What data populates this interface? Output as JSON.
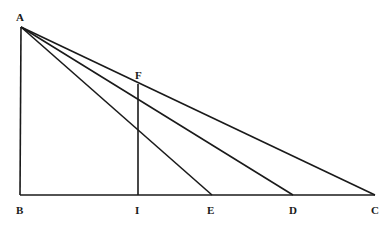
{
  "diagram": {
    "labels": {
      "A": "A",
      "B": "B",
      "I": "I",
      "E": "E",
      "D": "D",
      "C": "C",
      "F": "F"
    },
    "points": {
      "A": [
        21,
        27
      ],
      "B": [
        20,
        195
      ],
      "I": [
        138,
        195
      ],
      "E": [
        212,
        195
      ],
      "D": [
        293,
        195
      ],
      "C": [
        375,
        195
      ],
      "F": [
        138,
        84
      ]
    },
    "segments": [
      [
        "A",
        "B"
      ],
      [
        "B",
        "C"
      ],
      [
        "A",
        "E"
      ],
      [
        "A",
        "D"
      ],
      [
        "A",
        "C"
      ],
      [
        "F",
        "I"
      ]
    ],
    "stroke_color": "#1a1a1a"
  }
}
